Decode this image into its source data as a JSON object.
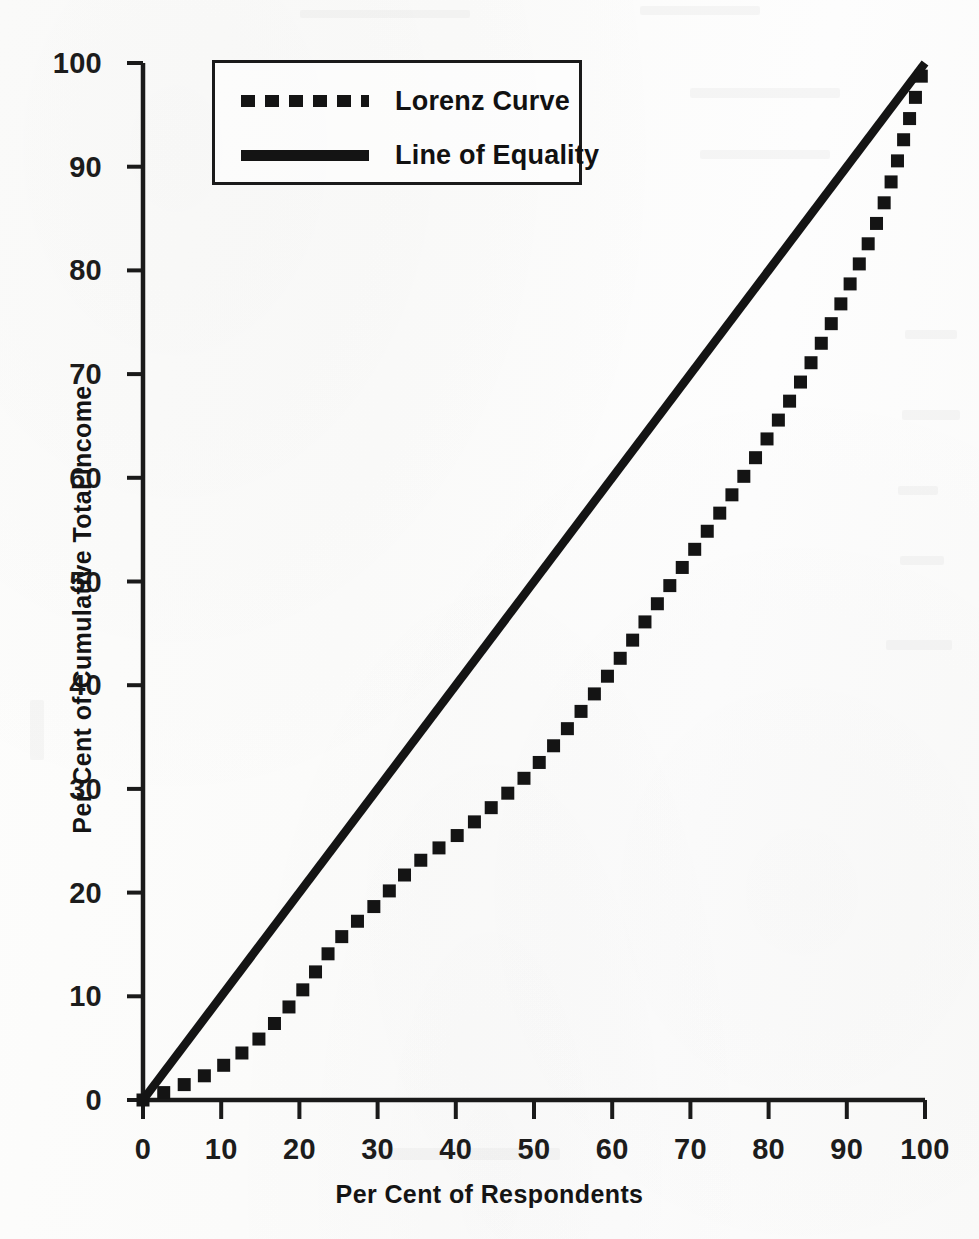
{
  "chart_data": {
    "type": "line",
    "title": "",
    "xlabel": "Per Cent of Respondents",
    "ylabel": "Per Cent of Cumulative Total Income",
    "xlim": [
      0,
      100
    ],
    "ylim": [
      0,
      100
    ],
    "grid": false,
    "legend_position": "upper left inside plot",
    "x_ticks": [
      "0",
      "10",
      "20",
      "30",
      "40",
      "50",
      "60",
      "70",
      "80",
      "90",
      "100"
    ],
    "y_ticks": [
      "0",
      "10",
      "20",
      "30",
      "40",
      "50",
      "60",
      "70",
      "80",
      "90",
      "100"
    ],
    "series": [
      {
        "name": "Lorenz Curve",
        "style": "dotted",
        "color": "#141414",
        "x": [
          0,
          5,
          10,
          15,
          20,
          25,
          30,
          35,
          40,
          45,
          50,
          55,
          60,
          65,
          70,
          75,
          80,
          85,
          90,
          95,
          100
        ],
        "values": [
          0,
          1.4,
          3.2,
          6.0,
          10.2,
          15.4,
          19.0,
          22.8,
          25.4,
          28.5,
          32.0,
          36.5,
          41.5,
          47.0,
          52.5,
          58.0,
          64.0,
          70.5,
          78.0,
          87.0,
          100
        ]
      },
      {
        "name": "Line of Equality",
        "style": "solid",
        "color": "#141414",
        "x": [
          0,
          100
        ],
        "values": [
          0,
          100
        ]
      }
    ]
  },
  "legend": {
    "items": [
      {
        "label": "Lorenz Curve",
        "style": "dotted"
      },
      {
        "label": "Line of Equality",
        "style": "solid"
      }
    ]
  },
  "axes": {
    "x_title": "Per Cent of Respondents",
    "y_title": "Per Cent of Cumulative Total Income"
  }
}
